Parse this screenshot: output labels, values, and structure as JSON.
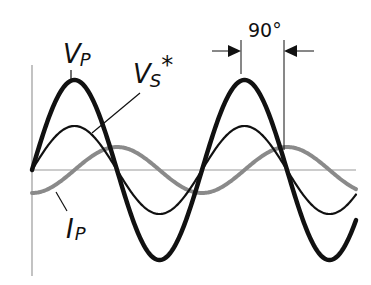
{
  "diagram": {
    "type": "waveform",
    "labels": {
      "vp_main": "V",
      "vp_sub": "P",
      "vs_main": "V",
      "vs_sub": "S",
      "vs_star": "*",
      "ip_main": "I",
      "ip_sub": "P",
      "phase": "90°"
    },
    "series": [
      {
        "name": "Vp",
        "color": "#111111",
        "stroke_width": 4.5,
        "amplitude": 90,
        "phase_deg": 0
      },
      {
        "name": "Vs*",
        "color": "#111111",
        "stroke_width": 2.2,
        "amplitude": 44,
        "phase_deg": 0
      },
      {
        "name": "Ip",
        "color": "#8a8a8a",
        "stroke_width": 4,
        "amplitude": 23,
        "phase_deg": -90
      }
    ],
    "axis_color": "#9a9a9a",
    "phase_shift_deg": 90
  }
}
